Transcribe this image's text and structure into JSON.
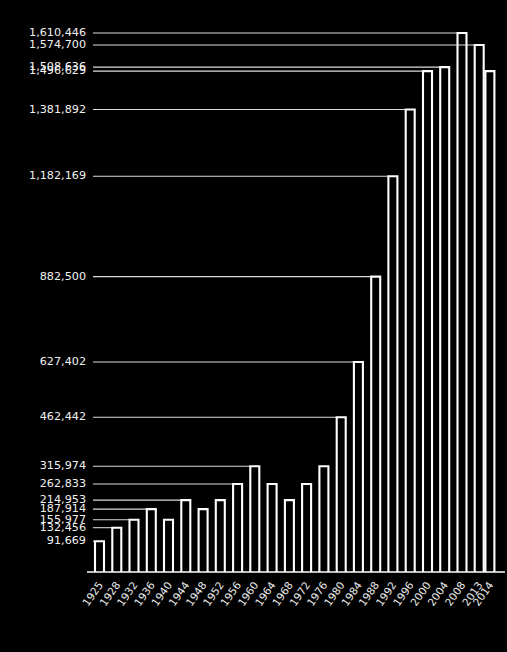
{
  "chart_data": {
    "type": "bar",
    "title": "",
    "subtitle": "",
    "xlabel": "",
    "ylabel": "",
    "grid": false,
    "legend": null,
    "orientation": "vertical",
    "bar_style": "outlined",
    "background_color": "#000000",
    "bar_color": "#ffffff",
    "label_color": "#f2f2f2",
    "ylim": [
      0,
      1610446
    ],
    "categories": [
      "1925",
      "1928",
      "1932",
      "1936",
      "1940",
      "1944",
      "1948",
      "1952",
      "1956",
      "1960",
      "1964",
      "1968",
      "1972",
      "1976",
      "1980",
      "1984",
      "1988",
      "1992",
      "1996",
      "2000",
      "2004",
      "2008",
      "2013",
      "2014"
    ],
    "values": [
      91669,
      132456,
      155977,
      187914,
      155977,
      214953,
      187914,
      214953,
      262833,
      315974,
      262833,
      214953,
      262833,
      315974,
      462442,
      627402,
      882500,
      1182169,
      1381892,
      1496629,
      1508636,
      1610446,
      1574700,
      1496629
    ],
    "labeled_values": [
      {
        "label": "1,610,446",
        "value": 1610446
      },
      {
        "label": "1,574,700",
        "value": 1574700
      },
      {
        "label": "1,508,636",
        "value": 1508636
      },
      {
        "label": "1,496,629",
        "value": 1496629
      },
      {
        "label": "1,381,892",
        "value": 1381892
      },
      {
        "label": "1,182,169",
        "value": 1182169
      },
      {
        "label": "882,500",
        "value": 882500
      },
      {
        "label": "627,402",
        "value": 627402
      },
      {
        "label": "462,442",
        "value": 462442
      },
      {
        "label": "315,974",
        "value": 315974
      },
      {
        "label": "262,833",
        "value": 262833
      },
      {
        "label": "214,953",
        "value": 214953
      },
      {
        "label": "187,914",
        "value": 187914
      },
      {
        "label": "155,977",
        "value": 155977
      },
      {
        "label": "132,456",
        "value": 132456
      },
      {
        "label": "91,669",
        "value": 91669
      }
    ]
  },
  "axis": {
    "x_tick_labels": [
      "1925",
      "1928",
      "1932",
      "1936",
      "1940",
      "1944",
      "1948",
      "1952",
      "1956",
      "1960",
      "1964",
      "1968",
      "1972",
      "1976",
      "1980",
      "1984",
      "1988",
      "1992",
      "1996",
      "2000",
      "2004",
      "2008",
      "2013",
      "2014"
    ]
  }
}
